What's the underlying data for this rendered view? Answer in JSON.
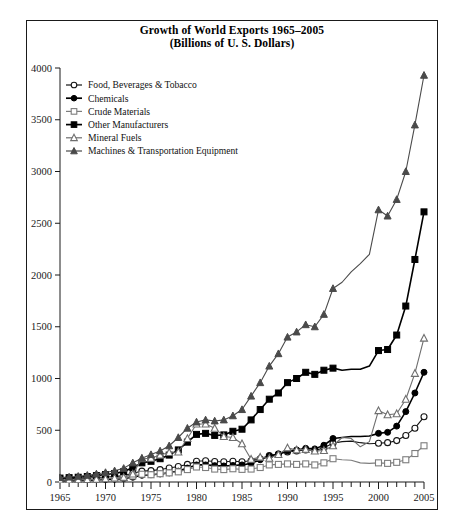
{
  "chart_data": {
    "type": "line",
    "title": "Growth of World Exports 1965–2005",
    "subtitle": "(Billions of U. S. Dollars)",
    "xlabel": "",
    "ylabel": "",
    "xlim": [
      1965,
      2005
    ],
    "ylim": [
      0,
      4000
    ],
    "ytick_step": 500,
    "xtick_step": 1,
    "xtick_label_step": 5,
    "grid": false,
    "legend_position": "upper-left-inside",
    "ytick_labels": [
      "0",
      "500",
      "1000",
      "1500",
      "2000",
      "2500",
      "3000",
      "3500",
      "4000"
    ],
    "xtick_labels": [
      "1965",
      "1970",
      "1975",
      "1980",
      "1985",
      "1990",
      "1995",
      "2000",
      "2005"
    ],
    "x": [
      1965,
      1966,
      1967,
      1968,
      1969,
      1970,
      1971,
      1972,
      1973,
      1974,
      1975,
      1976,
      1977,
      1978,
      1979,
      1980,
      1981,
      1982,
      1983,
      1984,
      1985,
      1986,
      1987,
      1988,
      1989,
      1990,
      1991,
      1992,
      1993,
      1994,
      1995,
      1996,
      1997,
      1998,
      1999,
      2000,
      2001,
      2002,
      2003,
      2004,
      2005
    ],
    "series": [
      {
        "name": "Food, Beverages & Tobacco",
        "marker": "open-circle",
        "color": "#141414",
        "values": [
          30,
          33,
          35,
          38,
          43,
          48,
          52,
          62,
          85,
          105,
          110,
          120,
          135,
          150,
          170,
          200,
          205,
          198,
          195,
          200,
          195,
          205,
          225,
          255,
          270,
          290,
          300,
          310,
          305,
          330,
          375,
          390,
          395,
          380,
          370,
          375,
          380,
          400,
          450,
          520,
          630
        ]
      },
      {
        "name": "Chemicals",
        "marker": "filled-circle",
        "color": "#000000",
        "values": [
          12,
          13,
          15,
          17,
          20,
          24,
          27,
          33,
          46,
          65,
          70,
          78,
          88,
          105,
          135,
          165,
          165,
          158,
          155,
          160,
          165,
          180,
          215,
          250,
          270,
          300,
          310,
          325,
          320,
          355,
          420,
          430,
          440,
          440,
          445,
          470,
          480,
          540,
          680,
          860,
          1060
        ]
      },
      {
        "name": "Crude Materials",
        "marker": "open-square",
        "color": "#7d7d7d",
        "values": [
          22,
          23,
          24,
          26,
          29,
          34,
          34,
          40,
          58,
          75,
          70,
          80,
          88,
          98,
          120,
          145,
          140,
          125,
          120,
          128,
          122,
          125,
          140,
          165,
          170,
          175,
          170,
          175,
          165,
          185,
          225,
          215,
          210,
          185,
          180,
          185,
          180,
          190,
          215,
          275,
          350
        ]
      },
      {
        "name": "Other Manufacturers",
        "marker": "filled-square",
        "color": "#000000",
        "values": [
          38,
          42,
          46,
          53,
          62,
          72,
          82,
          100,
          140,
          185,
          200,
          225,
          260,
          310,
          385,
          460,
          470,
          450,
          455,
          490,
          510,
          600,
          700,
          800,
          860,
          960,
          1000,
          1060,
          1040,
          1080,
          1100,
          1080,
          1090,
          1090,
          1120,
          1270,
          1280,
          1420,
          1700,
          2150,
          2610
        ]
      },
      {
        "name": "Mineral Fuels",
        "marker": "open-triangle",
        "color": "#6e6e6e",
        "values": [
          18,
          19,
          21,
          23,
          26,
          31,
          38,
          45,
          78,
          225,
          230,
          260,
          285,
          290,
          420,
          560,
          560,
          520,
          440,
          430,
          370,
          220,
          240,
          230,
          265,
          330,
          310,
          315,
          300,
          305,
          350,
          430,
          420,
          340,
          390,
          690,
          650,
          660,
          800,
          1050,
          1390
        ]
      },
      {
        "name": "Machines & Transportation Equipment",
        "marker": "filled-triangle",
        "color": "#4a4a4a",
        "values": [
          42,
          48,
          55,
          65,
          78,
          92,
          108,
          132,
          185,
          230,
          265,
          300,
          350,
          430,
          520,
          580,
          600,
          590,
          600,
          640,
          700,
          830,
          960,
          1120,
          1240,
          1400,
          1450,
          1520,
          1500,
          1620,
          1870,
          1930,
          2030,
          2110,
          2200,
          2630,
          2570,
          2730,
          3000,
          3450,
          3930
        ]
      }
    ]
  },
  "legend": {
    "items": [
      {
        "label": "Food, Beverages & Tobacco"
      },
      {
        "label": "Chemicals"
      },
      {
        "label": "Crude Materials"
      },
      {
        "label": "Other Manufacturers"
      },
      {
        "label": "Mineral Fuels"
      },
      {
        "label": "Machines & Transportation Equipment"
      }
    ]
  }
}
